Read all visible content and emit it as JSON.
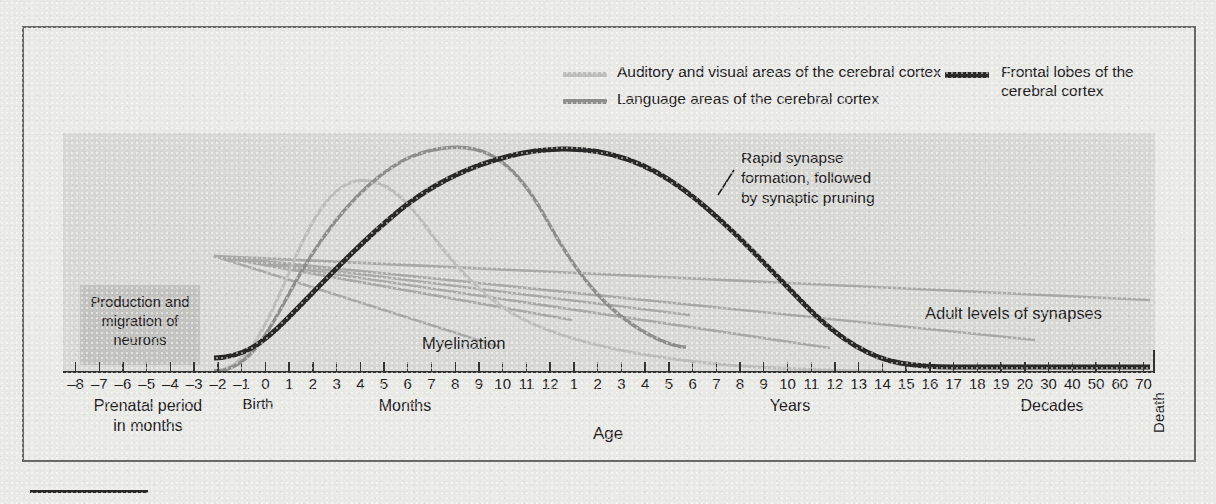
{
  "figure": {
    "colors": {
      "paper": "#e9e9e6",
      "plot_background": "#d8d8d4",
      "prenatal_box": "#c3c3bf",
      "frame": "#6c6a66",
      "auditory_visual": "#bdbdb9",
      "language": "#8e8e8a",
      "frontal": "#2b2927",
      "myelination": "#a9a9a5"
    }
  },
  "legend": {
    "items": [
      {
        "label": "Auditory and visual areas of the cerebral cortex",
        "color_key": "auditory_visual",
        "swatch_name": "legend-swatch-auditory-visual"
      },
      {
        "label": "Language areas of the cerebral cortex",
        "color_key": "language",
        "swatch_name": "legend-swatch-language"
      },
      {
        "label": "Frontal lobes of the\ncerebral cortex",
        "color_key": "frontal",
        "swatch_name": "legend-swatch-frontal"
      }
    ]
  },
  "annotations": {
    "prenatal_box": "Production\nand migration\nof neurons",
    "rapid_synapse": "Rapid synapse\nformation, followed\nby synaptic pruning",
    "myelination": "Myelination",
    "adult_levels": "Adult levels of synapses",
    "death": "Death"
  },
  "axis": {
    "title": "Age",
    "tick_labels": [
      "–8",
      "–7",
      "–6",
      "–5",
      "–4",
      "–3",
      "–2",
      "–1",
      "0",
      "1",
      "2",
      "3",
      "4",
      "5",
      "6",
      "7",
      "8",
      "9",
      "10",
      "11",
      "12",
      "1",
      "2",
      "3",
      "4",
      "5",
      "6",
      "7",
      "8",
      "9",
      "10",
      "11",
      "12",
      "13",
      "14",
      "15",
      "16",
      "17",
      "18",
      "19",
      "20",
      "30",
      "40",
      "50",
      "60",
      "70"
    ],
    "categories": [
      {
        "label": "Prenatal period\nin months",
        "name": "category-prenatal"
      },
      {
        "label": "Birth",
        "name": "category-birth"
      },
      {
        "label": "Months",
        "name": "category-months"
      },
      {
        "label": "Years",
        "name": "category-years"
      },
      {
        "label": "Decades",
        "name": "category-decades"
      }
    ]
  },
  "chart_data": {
    "type": "line",
    "title": "",
    "xlabel": "Age",
    "ylabel": "",
    "grid": false,
    "legend_position": "top",
    "x_axis": {
      "tick_labels": [
        "–8",
        "–7",
        "–6",
        "–5",
        "–4",
        "–3",
        "–2",
        "–1",
        "0",
        "1",
        "2",
        "3",
        "4",
        "5",
        "6",
        "7",
        "8",
        "9",
        "10",
        "11",
        "12",
        "1",
        "2",
        "3",
        "4",
        "5",
        "6",
        "7",
        "8",
        "9",
        "10",
        "11",
        "12",
        "13",
        "14",
        "15",
        "16",
        "17",
        "18",
        "19",
        "20",
        "30",
        "40",
        "50",
        "60",
        "70"
      ],
      "segments": [
        "Prenatal period in months",
        "Birth",
        "Months",
        "Years",
        "Decades"
      ],
      "range": [
        "-8 months",
        "70 years / Death"
      ]
    },
    "series": [
      {
        "name": "Auditory and visual areas of the cerebral cortex",
        "color": "#bdbdb9",
        "peak_x": "4–5 months",
        "relative_peak_height": 0.8,
        "points": [
          {
            "x": "-2 months",
            "y": 0.0
          },
          {
            "x": "0 months",
            "y": 0.05
          },
          {
            "x": "1 month",
            "y": 0.35
          },
          {
            "x": "2 months",
            "y": 0.62
          },
          {
            "x": "3 months",
            "y": 0.74
          },
          {
            "x": "4 months",
            "y": 0.79
          },
          {
            "x": "5 months",
            "y": 0.8
          },
          {
            "x": "6 months",
            "y": 0.77
          },
          {
            "x": "8 months",
            "y": 0.68
          },
          {
            "x": "10 months",
            "y": 0.57
          },
          {
            "x": "12 months",
            "y": 0.47
          },
          {
            "x": "2 years",
            "y": 0.33
          },
          {
            "x": "5 years",
            "y": 0.2
          },
          {
            "x": "10 years",
            "y": 0.09
          },
          {
            "x": "14 years",
            "y": 0.02
          }
        ]
      },
      {
        "name": "Language areas of the cerebral cortex",
        "color": "#8e8e8a",
        "peak_x": "9 months",
        "relative_peak_height": 0.96,
        "points": [
          {
            "x": "-2 months",
            "y": 0.0
          },
          {
            "x": "0 months",
            "y": 0.04
          },
          {
            "x": "2 months",
            "y": 0.3
          },
          {
            "x": "4 months",
            "y": 0.6
          },
          {
            "x": "6 months",
            "y": 0.82
          },
          {
            "x": "8 months",
            "y": 0.94
          },
          {
            "x": "9 months",
            "y": 0.96
          },
          {
            "x": "11 months",
            "y": 0.9
          },
          {
            "x": "12 months",
            "y": 0.83
          },
          {
            "x": "2 years",
            "y": 0.62
          },
          {
            "x": "3 years",
            "y": 0.42
          },
          {
            "x": "4 years",
            "y": 0.28
          },
          {
            "x": "5 years",
            "y": 0.2
          },
          {
            "x": "6 years",
            "y": 0.17
          }
        ]
      },
      {
        "name": "Frontal lobes of the cerebral cortex",
        "color": "#2b2927",
        "peak_x": "2–3 years",
        "relative_peak_height": 0.95,
        "points": [
          {
            "x": "-2 months",
            "y": 0.0
          },
          {
            "x": "0 months",
            "y": 0.02
          },
          {
            "x": "3 months",
            "y": 0.18
          },
          {
            "x": "6 months",
            "y": 0.38
          },
          {
            "x": "9 months",
            "y": 0.58
          },
          {
            "x": "12 months",
            "y": 0.76
          },
          {
            "x": "2 years",
            "y": 0.93
          },
          {
            "x": "3 years",
            "y": 0.95
          },
          {
            "x": "4 years",
            "y": 0.9
          },
          {
            "x": "6 years",
            "y": 0.78
          },
          {
            "x": "8 years",
            "y": 0.62
          },
          {
            "x": "10 years",
            "y": 0.45
          },
          {
            "x": "12 years",
            "y": 0.28
          },
          {
            "x": "14 years",
            "y": 0.14
          },
          {
            "x": "16 years",
            "y": 0.06
          },
          {
            "x": "20 years",
            "y": 0.06
          },
          {
            "x": "70 years",
            "y": 0.06
          }
        ]
      },
      {
        "name": "Myelination",
        "color": "#a9a9a5",
        "note": "fan of straight lines radiating from about –2 months, declining across months and years",
        "lines": [
          {
            "from": "-2 months",
            "to": "6 years"
          },
          {
            "from": "-2 months",
            "to": "5 years"
          },
          {
            "from": "-2 months",
            "to": "9 years"
          },
          {
            "from": "-2 months",
            "to": "12 years"
          },
          {
            "from": "-2 months",
            "to": "15 years"
          },
          {
            "from": "-2 months",
            "to": "16 years"
          }
        ]
      }
    ],
    "annotations": [
      {
        "text": "Production and migration of neurons",
        "x": "prenatal period"
      },
      {
        "text": "Rapid synapse formation, followed by synaptic pruning",
        "x": "3–4 years"
      },
      {
        "text": "Myelination",
        "x": "4–6 months"
      },
      {
        "text": "Adult levels of synapses",
        "x": "18–60 years"
      },
      {
        "text": "Death",
        "x": "end of axis"
      }
    ]
  }
}
